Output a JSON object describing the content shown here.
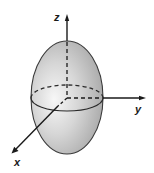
{
  "figure": {
    "type": "ellipsoid-3d-axes",
    "shape": "prolate ellipsoid (egg shape) centered at origin, elongated along z",
    "fill_color_light": "#f4f4f4",
    "fill_color_dark": "#a8a8a8",
    "outline_color": "#3a3a3a",
    "axis_color": "#1a1a1a"
  },
  "axes": {
    "x": {
      "label": "x"
    },
    "y": {
      "label": "y"
    },
    "z": {
      "label": "z"
    }
  }
}
